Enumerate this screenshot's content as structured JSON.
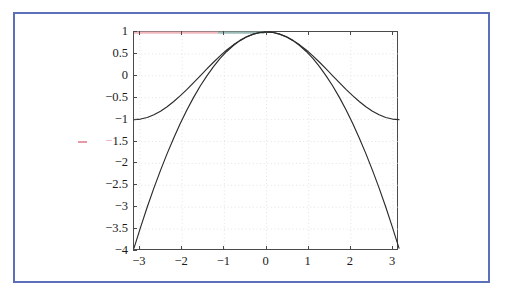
{
  "figure": {
    "border_color": "#5b6fba",
    "background": "#ffffff",
    "axis_color": "#4a4a4a",
    "grid_color": "#dcdcdc",
    "curve_color": "#2b2b2b",
    "overlay_pink": "#f2b8be",
    "overlay_teal": "#9dbdb8"
  },
  "chart_data": {
    "type": "line",
    "title": "",
    "xlabel": "",
    "ylabel": "",
    "xlim": [
      -3.14159265,
      3.14159265
    ],
    "ylim": [
      -4,
      1
    ],
    "grid": true,
    "grid_style": "dotted",
    "legend": "none",
    "xticks": [
      -3,
      -2,
      -1,
      0,
      1,
      2,
      3
    ],
    "xtick_labels": [
      "−3",
      "−2",
      "−1",
      "0",
      "1",
      "2",
      "3"
    ],
    "yticks": [
      1,
      0.5,
      0,
      -0.5,
      -1,
      -1.5,
      -2,
      -2.5,
      -3,
      -3.5,
      -4
    ],
    "ytick_labels": [
      "1",
      "0.5",
      "0",
      "−0.5",
      "−1",
      "−1.5",
      "−2",
      "−2.5",
      "−3",
      "−3.5",
      "−4"
    ],
    "series": [
      {
        "name": "cos(x)",
        "expression": "cos(x)",
        "color": "#2b2b2b",
        "x": [
          -3.14159,
          -2.9845,
          -2.8274,
          -2.6704,
          -2.5133,
          -2.3562,
          -2.1991,
          -2.042,
          -1.885,
          -1.7279,
          -1.5708,
          -1.4137,
          -1.2566,
          -1.0996,
          -0.9425,
          -0.7854,
          -0.6283,
          -0.4712,
          -0.3142,
          -0.1571,
          0,
          0.1571,
          0.3142,
          0.4712,
          0.6283,
          0.7854,
          0.9425,
          1.0996,
          1.2566,
          1.4137,
          1.5708,
          1.7279,
          1.885,
          2.042,
          2.1991,
          2.3562,
          2.5133,
          2.6704,
          2.8274,
          2.9845,
          3.14159
        ],
        "y": [
          -1.0,
          -0.9877,
          -0.9511,
          -0.891,
          -0.809,
          -0.7071,
          -0.5878,
          -0.454,
          -0.309,
          -0.1564,
          0.0,
          0.1564,
          0.309,
          0.454,
          0.5878,
          0.7071,
          0.809,
          0.891,
          0.9511,
          0.9877,
          1.0,
          0.9877,
          0.9511,
          0.891,
          0.809,
          0.7071,
          0.5878,
          0.454,
          0.309,
          0.1564,
          0.0,
          -0.1564,
          -0.309,
          -0.454,
          -0.5878,
          -0.7071,
          -0.809,
          -0.891,
          -0.9511,
          -0.9877,
          -1.0
        ]
      },
      {
        "name": "1 - x^2/2",
        "expression": "1 - x^2/2",
        "color": "#2b2b2b",
        "x": [
          -3.14159,
          -2.9845,
          -2.8274,
          -2.6704,
          -2.5133,
          -2.3562,
          -2.1991,
          -2.042,
          -1.885,
          -1.7279,
          -1.5708,
          -1.4137,
          -1.2566,
          -1.0996,
          -0.9425,
          -0.7854,
          -0.6283,
          -0.4712,
          -0.3142,
          -0.1571,
          0,
          0.1571,
          0.3142,
          0.4712,
          0.6283,
          0.7854,
          0.9425,
          1.0996,
          1.2566,
          1.4137,
          1.5708,
          1.7279,
          1.885,
          2.042,
          2.1991,
          2.3562,
          2.5133,
          2.6704,
          2.8274,
          2.9845,
          3.14159
        ],
        "y": [
          -3.9348,
          -3.4537,
          -2.9966,
          -2.5655,
          -2.1585,
          -1.7765,
          -1.418,
          -1.0849,
          -0.7764,
          -0.4927,
          -0.2337,
          -0.0005,
          0.2105,
          0.3957,
          0.5558,
          0.6916,
          0.8026,
          0.889,
          0.9507,
          0.9877,
          1.0,
          0.9877,
          0.9507,
          0.889,
          0.8026,
          0.6916,
          0.5558,
          0.3957,
          0.2105,
          -0.0005,
          -0.2337,
          -0.4927,
          -0.7764,
          -1.0849,
          -1.418,
          -1.7765,
          -2.1585,
          -2.5655,
          -2.9966,
          -3.4537,
          -3.9348
        ]
      }
    ],
    "annotations": [
      {
        "name": "pink-overlay-top",
        "type": "segment",
        "color": "#f2b8be",
        "x0": -3.14159,
        "x1": -1.15,
        "y": 1
      },
      {
        "name": "teal-overlay-top",
        "type": "segment",
        "color": "#9dbdb8",
        "x0": -1.15,
        "x1": -0.05,
        "y": 1
      },
      {
        "name": "pink-tick-dash",
        "type": "dash",
        "color": "#e79aa6",
        "y": -1.5
      }
    ]
  }
}
